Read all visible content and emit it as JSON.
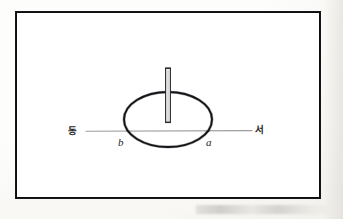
{
  "figure": {
    "type": "astronomical-diagram",
    "frame": {
      "border_color": "#16161a",
      "background_color": "#ffffff"
    },
    "direction_labels": {
      "east": "동",
      "west": "서"
    },
    "point_labels": {
      "left_point": "b",
      "right_point": "a"
    },
    "elements": {
      "ellipse_name": "shadow-circle",
      "rod_name": "gnomon-rod",
      "axis_name": "east-west-axis"
    },
    "colors": {
      "ink": "#16161a",
      "axis_line": "#9c9c9e",
      "rod_fill": "#f2f2f2",
      "rod_stroke": "#3a3a3e"
    },
    "geometry": {
      "ellipse_center_x": 168,
      "ellipse_center_y": 119,
      "ellipse_radius_x": 44,
      "ellipse_radius_y": 27,
      "axis_y": 131,
      "axis_x_start": 86,
      "axis_x_end": 252,
      "rod_x": 168,
      "rod_top_y": 68,
      "rod_bottom_y": 122,
      "rod_width": 5
    }
  }
}
